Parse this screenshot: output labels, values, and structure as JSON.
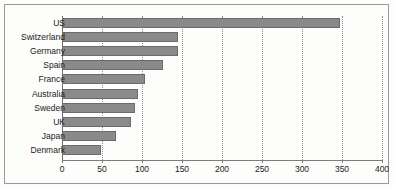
{
  "chart_data": {
    "type": "bar",
    "orientation": "horizontal",
    "title": "",
    "subtitle": "",
    "xlabel": "",
    "ylabel": "",
    "categories": [
      "US",
      "Switzerland",
      "Germany",
      "Spain",
      "France",
      "Australia",
      "Sweden",
      "UK",
      "Japan",
      "Denmark"
    ],
    "values": [
      347,
      145,
      145,
      126,
      104,
      95,
      91,
      86,
      68,
      49
    ],
    "series": [
      {
        "name": "value",
        "values": [
          347,
          145,
          145,
          126,
          104,
          95,
          91,
          86,
          68,
          49
        ]
      }
    ],
    "xlim": [
      0,
      400
    ],
    "ylim": null,
    "xticks": [
      0,
      50,
      100,
      150,
      200,
      250,
      300,
      350,
      400
    ],
    "xticklabels": [
      "0",
      "50",
      "100",
      "150",
      "200",
      "250",
      "300",
      "350",
      "400"
    ],
    "grid": true,
    "grid_axis": "x",
    "grid_style": "dotted",
    "legend": false,
    "legend_position": "none",
    "bar_color": "#8a8a8a",
    "bar_edge_color": "#6b6b6b",
    "axis_color": "#7d7d7d",
    "grid_color": "#8d8d8d",
    "frame_color": "#9a9a9a",
    "background_color": "#fdfdfc",
    "text_color": "#1a1a1a"
  }
}
